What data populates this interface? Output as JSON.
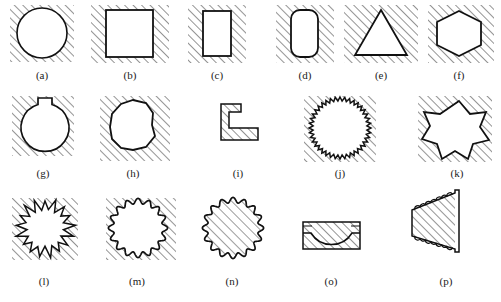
{
  "figure": {
    "title": "",
    "background_color": "#ffffff",
    "line_color": "#111111",
    "hatch_color": "#3a3a3a",
    "hatch_angle_deg": 45,
    "hatch_spacing_px": 6,
    "rows": 3,
    "columns": [
      6,
      5,
      5
    ],
    "panels": [
      {
        "id": "a",
        "label": "(a)",
        "shape": "circle",
        "shape_name": "smooth-circle",
        "fill": "background-hatched",
        "description": "circle hole in hatched field"
      },
      {
        "id": "b",
        "label": "(b)",
        "shape": "square",
        "shape_name": "square",
        "fill": "background-hatched",
        "description": "square hole in hatched field"
      },
      {
        "id": "c",
        "label": "(c)",
        "shape": "rectangle",
        "shape_name": "tall-rectangle",
        "fill": "background-hatched",
        "description": "narrow tall rectangle hole"
      },
      {
        "id": "d",
        "label": "(d)",
        "shape": "rounded-rectangle",
        "shape_name": "rounded-tall-rectangle",
        "fill": "background-hatched",
        "description": "tall rectangle with rounded corners"
      },
      {
        "id": "e",
        "label": "(e)",
        "shape": "triangle",
        "shape_name": "triangle",
        "fill": "background-hatched",
        "description": "triangular hole in hatched field"
      },
      {
        "id": "f",
        "label": "(f)",
        "shape": "hexagon",
        "shape_name": "hexagon",
        "fill": "background-hatched",
        "description": "hexagonal hole in hatched field"
      },
      {
        "id": "g",
        "label": "(g)",
        "shape": "circle-with-notch",
        "shape_name": "circle-with-keyway",
        "fill": "background-hatched",
        "description": "circle with small rectangular key notch on top"
      },
      {
        "id": "h",
        "label": "(h)",
        "shape": "polygon-irregular",
        "shape_name": "coarse-polygonal-circle",
        "fill": "background-hatched",
        "description": "circle approximated by coarse straight facets"
      },
      {
        "id": "i",
        "label": "(i)",
        "shape": "l-bracket",
        "shape_name": "l-shaped-angle-section",
        "fill": "shape-hatched",
        "description": "L-shaped angle section, hatched solid"
      },
      {
        "id": "j",
        "label": "(j)",
        "shape": "star-fine",
        "shape_name": "fine-serrated-circle",
        "fill": "background-hatched",
        "description": "circle with fine saw-tooth serrations"
      },
      {
        "id": "k",
        "label": "(k)",
        "shape": "star-8",
        "shape_name": "eight-point-star",
        "fill": "background-hatched",
        "description": "eight-pointed star hole"
      },
      {
        "id": "l",
        "label": "(l)",
        "shape": "star-jagged",
        "shape_name": "irregular-jagged-circle",
        "fill": "background-hatched",
        "description": "circle with irregular jagged spikes"
      },
      {
        "id": "m",
        "label": "(m)",
        "shape": "scalloped-circle",
        "shape_name": "wavy-scalloped-circle",
        "fill": "background-hatched",
        "description": "circle with smooth wavy scalloped edge"
      },
      {
        "id": "n",
        "label": "(n)",
        "shape": "scalloped-circle",
        "shape_name": "scalloped-disc",
        "fill": "shape-hatched",
        "description": "scalloped disc hatched inside, no surrounding field"
      },
      {
        "id": "o",
        "label": "(o)",
        "shape": "block-with-recess",
        "shape_name": "block-with-concave-recess",
        "fill": "shape-hatched",
        "description": "rectangular block with curved concave recess in top face"
      },
      {
        "id": "p",
        "label": "(p)",
        "shape": "tapered-wedge",
        "shape_name": "tapered-wedge-scalloped",
        "fill": "shape-hatched",
        "description": "tapered wedge bracket with scalloped arc edges top and bottom"
      }
    ]
  }
}
